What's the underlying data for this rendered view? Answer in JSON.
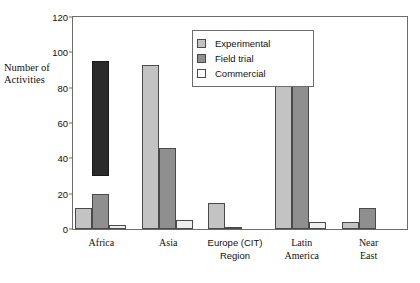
{
  "chart_data": {
    "type": "bar",
    "title": "",
    "xlabel": "",
    "ylabel": "Number of Activities",
    "ylim": [
      0,
      120
    ],
    "yticks": [
      0,
      20,
      40,
      60,
      80,
      100,
      120
    ],
    "grid": false,
    "legend_position": "top-center-inside",
    "categories": [
      "Africa",
      "Asia",
      "Europe (CIT)\nRegion",
      "Latin\nAmerica",
      "Near\nEast"
    ],
    "series": [
      {
        "name": "Experimental",
        "color": "#c3c3c3",
        "values": [
          12,
          93,
          15,
          89,
          4
        ]
      },
      {
        "name": "Field trial",
        "color": "#8f8f8f",
        "values": [
          20,
          46,
          1,
          110,
          12
        ]
      },
      {
        "name": "Commercial",
        "color": "#eeeeee",
        "values": [
          2,
          5,
          0,
          4,
          0
        ]
      }
    ],
    "annotations": [
      {
        "name": "africa-dark-bar",
        "category": "Africa",
        "color": "#2b2b2b",
        "y_bottom": 30,
        "y_top": 95
      }
    ]
  },
  "axis": {
    "y_title": "Number of\nActivities",
    "tick_labels": [
      "0",
      "20",
      "40",
      "60",
      "80",
      "100",
      "120"
    ]
  },
  "legend": {
    "items": [
      {
        "label": "Experimental",
        "swatch": "#c3c3c3"
      },
      {
        "label": "Field trial",
        "swatch": "#8f8f8f"
      },
      {
        "label": "Commercial",
        "swatch": "#ffffff"
      }
    ]
  }
}
